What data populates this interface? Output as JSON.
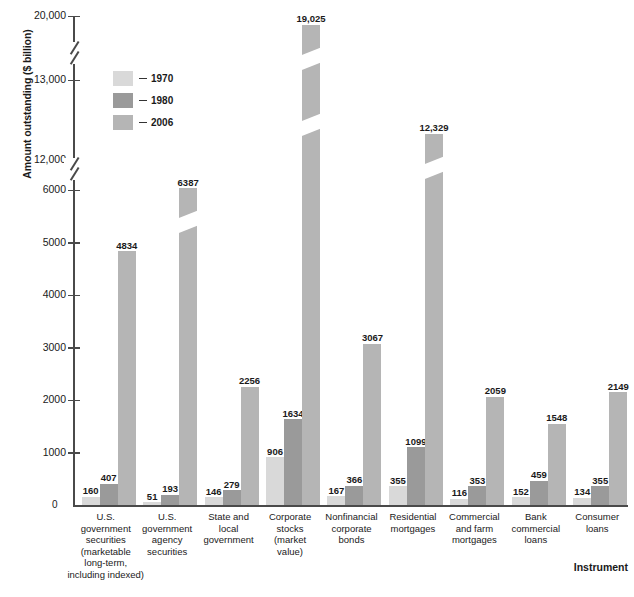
{
  "chart_data": {
    "type": "bar",
    "title": "",
    "xlabel": "Instrument",
    "ylabel": "Amount outstanding ($ billion)",
    "ylim": [
      0,
      20000
    ],
    "grid": false,
    "legend_position": "upper-left-inside",
    "axis_breaks": [
      [
        6000,
        12000
      ],
      [
        13000,
        20000
      ]
    ],
    "y_ticks": [
      "0",
      "1000",
      "2000",
      "3000",
      "4000",
      "5000",
      "6000",
      "12,000",
      "13,000",
      "20,000"
    ],
    "categories": [
      "U.S. government securities (marketable long-term, including indexed)",
      "U.S. government agency securities",
      "State and local government",
      "Corporate stocks (market value)",
      "Nonfinancial corporate bonds",
      "Residential mortgages",
      "Commercial and farm mortgages",
      "Bank commercial loans",
      "Consumer loans"
    ],
    "category_lines": [
      [
        "U.S.",
        "government",
        "securities",
        "(marketable",
        "long-term,",
        "including indexed)"
      ],
      [
        "U.S.",
        "government",
        "agency",
        "securities"
      ],
      [
        "State and",
        "local",
        "government"
      ],
      [
        "Corporate",
        "stocks",
        "(market",
        "value)"
      ],
      [
        "Nonfinancial",
        "corporate",
        "bonds"
      ],
      [
        "Residential",
        "mortgages"
      ],
      [
        "Commercial",
        "and farm",
        "mortgages"
      ],
      [
        "Bank",
        "commercial",
        "loans"
      ],
      [
        "Consumer",
        "loans"
      ]
    ],
    "series": [
      {
        "name": "1970",
        "color": "#d9d9d9",
        "values": [
          160,
          51,
          146,
          906,
          167,
          355,
          116,
          152,
          134
        ]
      },
      {
        "name": "1980",
        "color": "#9a9a9a",
        "values": [
          407,
          193,
          279,
          1634,
          366,
          1099,
          353,
          459,
          355
        ]
      },
      {
        "name": "2006",
        "color": "#b5b5b5",
        "values": [
          4834,
          6387,
          2256,
          19025,
          3067,
          12329,
          2059,
          1548,
          2149
        ]
      }
    ],
    "value_labels": [
      [
        "160",
        "407",
        "4834"
      ],
      [
        "51",
        "193",
        "6387"
      ],
      [
        "146",
        "279",
        "2256"
      ],
      [
        "906",
        "1634",
        "19,025"
      ],
      [
        "167",
        "366",
        "3067"
      ],
      [
        "355",
        "1099",
        "12,329"
      ],
      [
        "116",
        "353",
        "2059"
      ],
      [
        "152",
        "459",
        "1548"
      ],
      [
        "134",
        "355",
        "2149"
      ]
    ]
  },
  "legend": {
    "items": [
      {
        "label": "1970",
        "color": "#d9d9d9"
      },
      {
        "label": "1980",
        "color": "#9a9a9a"
      },
      {
        "label": "2006",
        "color": "#b5b5b5"
      }
    ]
  },
  "axis": {
    "y_title": "Amount outstanding ($ billion)",
    "x_title": "Instrument",
    "zero_label": "0"
  }
}
